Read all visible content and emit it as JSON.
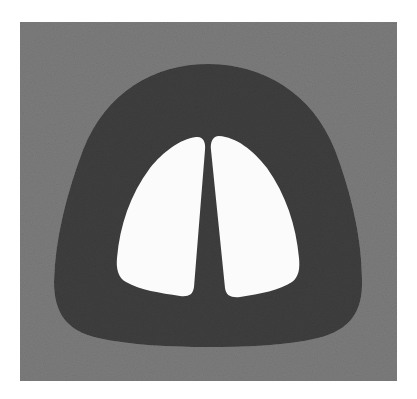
{
  "image": {
    "description": "Grayscale phantom image: dark dome-shaped body on a noisy gray square background, containing two white lobe-shaped regions separated by a dark central wedge",
    "colors": {
      "page_background": "#ffffff",
      "square_background": "#7c7c7c",
      "dome": "#3e3e3e",
      "lobes": "#fbfbfb"
    },
    "regions": {
      "square": {
        "x": 20,
        "y": 22,
        "width": 377,
        "height": 359
      },
      "dome": {
        "left": 53,
        "right": 363,
        "top": 63,
        "bottom": 347
      },
      "left_lobe": {
        "left": 116,
        "right": 205,
        "top": 136,
        "bottom": 296
      },
      "right_lobe": {
        "left": 210,
        "right": 300,
        "top": 135,
        "bottom": 297
      }
    }
  }
}
